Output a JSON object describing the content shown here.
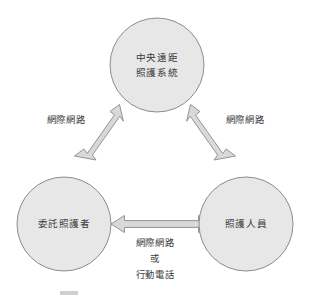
{
  "figure": {
    "title_fragment": "",
    "background_color": "#ffffff",
    "node_fill_color": "#e7e7e7",
    "node_stroke_color": "#8d8d8d",
    "arrow_fill_color": "#d9d9d9",
    "arrow_stroke_color": "#8a8a8a",
    "text_color": "#3a3a3a"
  },
  "nodes": [
    {
      "id": "central-telecare-system",
      "line1": "中央遠距",
      "line2": "照護系統",
      "cx": 157,
      "cy": 65,
      "r": 47
    },
    {
      "id": "commissioned-caregiver",
      "line1": "委託照護者",
      "line2": "",
      "cx": 64,
      "cy": 224,
      "r": 47
    },
    {
      "id": "care-personnel",
      "line1": "照護人員",
      "line2": "",
      "cx": 246,
      "cy": 224,
      "r": 47
    }
  ],
  "edges": [
    {
      "id": "edge-left",
      "label_lines": [
        "網際網路"
      ],
      "from": "commissioned-caregiver",
      "to": "central-telecare-system",
      "arrowheads": "both",
      "label_x": 66,
      "label_y": 120
    },
    {
      "id": "edge-right",
      "label_lines": [
        "網際網路"
      ],
      "from": "central-telecare-system",
      "to": "care-personnel",
      "arrowheads": "both",
      "label_x": 245,
      "label_y": 120
    },
    {
      "id": "edge-bottom",
      "label_lines": [
        "網際網路",
        "或",
        "行動電話"
      ],
      "from": "commissioned-caregiver",
      "to": "care-personnel",
      "arrowheads": "both",
      "label_x": 155,
      "label_y": 243
    }
  ],
  "caption": {
    "fragment": ""
  }
}
